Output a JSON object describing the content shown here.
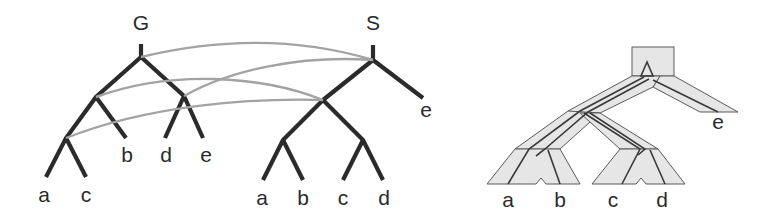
{
  "figure": {
    "panels": [
      {
        "id": "reconciliation-left",
        "gene_tree": {
          "label": "G",
          "leaves": [
            "a",
            "c",
            "b",
            "d",
            "e"
          ],
          "topology": "((((a,c),b),(d,e)))"
        },
        "species_tree": {
          "label": "S",
          "leaves": [
            "a",
            "b",
            "c",
            "d",
            "e"
          ],
          "topology": "(((a,b),(c,d)),e)"
        },
        "mapping_arcs": 4
      },
      {
        "id": "embedded-tree-right",
        "leaves": [
          "a",
          "b",
          "c",
          "d",
          "e"
        ],
        "description": "Gene tree embedded inside tubular species tree"
      }
    ],
    "labels": {
      "G": "G",
      "S": "S",
      "g_a": "a",
      "g_c": "c",
      "g_b": "b",
      "g_d": "d",
      "g_e": "e",
      "s_a": "a",
      "s_b": "b",
      "s_c": "c",
      "s_d": "d",
      "s_e": "e",
      "r_a": "a",
      "r_b": "b",
      "r_c": "c",
      "r_d": "d",
      "r_e": "e"
    },
    "colors": {
      "tree_edge": "#2b2b2b",
      "mapping_arc": "#a3a3a3",
      "tube_fill": "#e6e6e6",
      "tube_stroke": "#5a5a5a"
    }
  }
}
